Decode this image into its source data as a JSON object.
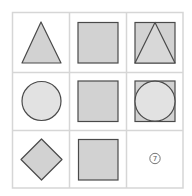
{
  "puzzle": {
    "type": "3x3 matrix reasoning",
    "rows": 3,
    "columns": 3,
    "colors": {
      "grid_line": "#d6d6d6",
      "shape_fill": "#d2d2d2",
      "inner_fill": "#e2e2e2",
      "stroke": "#4a4a4a",
      "background": "#ffffff"
    },
    "cells": [
      {
        "row": 1,
        "col": 1,
        "content": "triangle"
      },
      {
        "row": 1,
        "col": 2,
        "content": "square"
      },
      {
        "row": 1,
        "col": 3,
        "content": "square with inscribed triangle"
      },
      {
        "row": 2,
        "col": 1,
        "content": "circle"
      },
      {
        "row": 2,
        "col": 2,
        "content": "square"
      },
      {
        "row": 2,
        "col": 3,
        "content": "square with inscribed circle"
      },
      {
        "row": 3,
        "col": 1,
        "content": "diamond"
      },
      {
        "row": 3,
        "col": 2,
        "content": "square"
      },
      {
        "row": 3,
        "col": 3,
        "content": "missing (answer marker)"
      }
    ],
    "answer_marker": {
      "symbol": "7"
    }
  }
}
